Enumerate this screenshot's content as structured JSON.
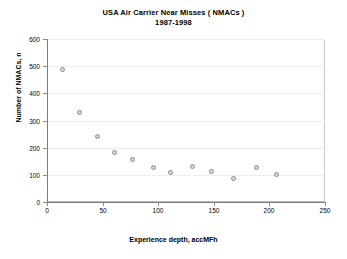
{
  "chart_data": {
    "type": "scatter",
    "title": "USA Air Carrier Near Misses ( NMACs )",
    "subtitle": "1987-1998",
    "xlabel": "Experience depth, accMFh",
    "ylabel": "Number of NMACs, n",
    "xlim": [
      0,
      250
    ],
    "ylim": [
      0,
      600
    ],
    "xticks": [
      0,
      50,
      100,
      150,
      200,
      250
    ],
    "yticks": [
      0,
      100,
      200,
      300,
      400,
      500,
      600
    ],
    "xtick_labels": [
      "0",
      "50",
      "100",
      "150",
      "200",
      "250"
    ],
    "ytick_labels": [
      "0",
      "100",
      "200",
      "300",
      "400",
      "500",
      "600"
    ],
    "grid": true,
    "legend": null,
    "marker": "open-circle-gray",
    "series": [
      {
        "name": "NMACs",
        "points": [
          {
            "x": 14,
            "y": 486
          },
          {
            "x": 29,
            "y": 329
          },
          {
            "x": 45,
            "y": 240
          },
          {
            "x": 61,
            "y": 182
          },
          {
            "x": 77,
            "y": 155
          },
          {
            "x": 96,
            "y": 127
          },
          {
            "x": 111,
            "y": 110
          },
          {
            "x": 131,
            "y": 131
          },
          {
            "x": 148,
            "y": 113
          },
          {
            "x": 168,
            "y": 88
          },
          {
            "x": 188,
            "y": 126
          },
          {
            "x": 206,
            "y": 100
          }
        ]
      }
    ]
  }
}
